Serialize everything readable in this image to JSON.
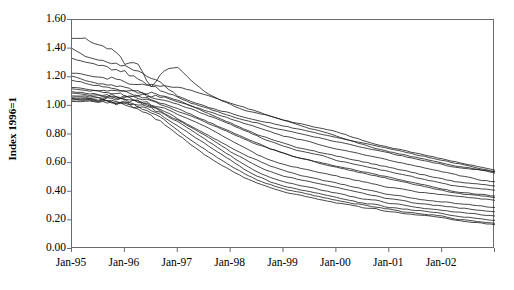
{
  "chart_data": {
    "type": "line",
    "title": "",
    "xlabel": "",
    "ylabel": "Index 1996=1",
    "ylim": [
      0.0,
      1.6
    ],
    "ytick_labels": [
      "1.60",
      "1.40",
      "1.20",
      "1.00",
      "0.80",
      "0.60",
      "0.40",
      "0.20",
      "0.00"
    ],
    "ytick_values": [
      1.6,
      1.4,
      1.2,
      1.0,
      0.8,
      0.6,
      0.4,
      0.2,
      0.0
    ],
    "xtick_labels": [
      "Jan-95",
      "Jan-96",
      "Jan-97",
      "Jan-98",
      "Jan-99",
      "Jan-00",
      "Jan-01",
      "Jan-02"
    ],
    "xlim_years": [
      1995.0,
      2003.0
    ],
    "grid": false,
    "legend": false,
    "legend_position": "none",
    "line_color": "#1a1a1a",
    "frame_color": "#6b6b6b",
    "series_count": 16,
    "x": [
      1995.0,
      1995.25,
      1995.5,
      1995.75,
      1996.0,
      1996.25,
      1996.5,
      1996.75,
      1997.0,
      1997.25,
      1997.5,
      1997.75,
      1998.0,
      1998.25,
      1998.5,
      1998.75,
      1999.0,
      1999.25,
      1999.5,
      1999.75,
      2000.0,
      2000.25,
      2000.5,
      2000.75,
      2001.0,
      2001.25,
      2001.5,
      2001.75,
      2002.0,
      2002.25,
      2002.5,
      2002.75,
      2003.0
    ],
    "series": [
      {
        "name": "series-01",
        "values": [
          1.47,
          1.47,
          1.42,
          1.4,
          1.3,
          1.28,
          1.13,
          1.25,
          1.27,
          1.18,
          1.1,
          1.05,
          1.01,
          0.97,
          0.95,
          0.93,
          0.9,
          0.88,
          0.86,
          0.84,
          0.82,
          0.79,
          0.76,
          0.73,
          0.71,
          0.69,
          0.67,
          0.65,
          0.63,
          0.61,
          0.59,
          0.57,
          0.55
        ]
      },
      {
        "name": "series-02",
        "values": [
          1.4,
          1.35,
          1.32,
          1.3,
          1.28,
          1.24,
          1.2,
          1.14,
          1.07,
          1.03,
          1.0,
          0.97,
          0.95,
          0.92,
          0.9,
          0.88,
          0.86,
          0.84,
          0.82,
          0.8,
          0.78,
          0.76,
          0.74,
          0.72,
          0.7,
          0.68,
          0.66,
          0.64,
          0.62,
          0.6,
          0.58,
          0.56,
          0.54
        ]
      },
      {
        "name": "series-03",
        "values": [
          1.33,
          1.31,
          1.29,
          1.26,
          1.23,
          1.19,
          1.14,
          1.1,
          1.06,
          1.02,
          0.99,
          0.96,
          0.93,
          0.9,
          0.88,
          0.85,
          0.83,
          0.81,
          0.79,
          0.77,
          0.75,
          0.73,
          0.71,
          0.69,
          0.67,
          0.65,
          0.63,
          0.61,
          0.59,
          0.57,
          0.56,
          0.55,
          0.53
        ]
      },
      {
        "name": "series-04",
        "values": [
          1.23,
          1.22,
          1.2,
          1.19,
          1.17,
          1.16,
          1.15,
          1.14,
          1.13,
          1.11,
          1.08,
          1.05,
          1.02,
          0.99,
          0.96,
          0.93,
          0.9,
          0.87,
          0.84,
          0.82,
          0.79,
          0.76,
          0.73,
          0.7,
          0.68,
          0.66,
          0.64,
          0.62,
          0.6,
          0.58,
          0.57,
          0.55,
          0.54
        ]
      },
      {
        "name": "series-05",
        "values": [
          1.21,
          1.18,
          1.16,
          1.14,
          1.12,
          1.1,
          1.09,
          1.07,
          1.04,
          1.0,
          0.97,
          0.94,
          0.91,
          0.88,
          0.85,
          0.82,
          0.79,
          0.77,
          0.75,
          0.72,
          0.7,
          0.68,
          0.66,
          0.64,
          0.62,
          0.6,
          0.58,
          0.56,
          0.54,
          0.52,
          0.5,
          0.48,
          0.47
        ]
      },
      {
        "name": "series-06",
        "values": [
          1.18,
          1.16,
          1.14,
          1.12,
          1.11,
          1.09,
          1.07,
          1.06,
          1.03,
          1.0,
          0.96,
          0.92,
          0.88,
          0.84,
          0.8,
          0.77,
          0.74,
          0.71,
          0.69,
          0.67,
          0.65,
          0.63,
          0.61,
          0.59,
          0.57,
          0.55,
          0.53,
          0.51,
          0.49,
          0.47,
          0.46,
          0.45,
          0.44
        ]
      },
      {
        "name": "series-07",
        "values": [
          1.13,
          1.12,
          1.11,
          1.11,
          1.1,
          1.08,
          1.06,
          1.04,
          1.01,
          0.98,
          0.94,
          0.91,
          0.87,
          0.83,
          0.79,
          0.75,
          0.72,
          0.69,
          0.67,
          0.65,
          0.62,
          0.6,
          0.58,
          0.56,
          0.54,
          0.52,
          0.5,
          0.48,
          0.46,
          0.44,
          0.43,
          0.42,
          0.41
        ]
      },
      {
        "name": "series-08",
        "values": [
          1.12,
          1.11,
          1.1,
          1.09,
          1.08,
          1.06,
          1.04,
          1.01,
          0.98,
          0.94,
          0.9,
          0.86,
          0.82,
          0.78,
          0.74,
          0.7,
          0.67,
          0.64,
          0.62,
          0.6,
          0.58,
          0.56,
          0.54,
          0.52,
          0.5,
          0.48,
          0.46,
          0.44,
          0.42,
          0.4,
          0.39,
          0.38,
          0.37
        ]
      },
      {
        "name": "series-09",
        "values": [
          1.1,
          1.09,
          1.08,
          1.07,
          1.06,
          1.05,
          1.03,
          1.0,
          0.96,
          0.93,
          0.89,
          0.85,
          0.81,
          0.77,
          0.73,
          0.7,
          0.67,
          0.64,
          0.62,
          0.59,
          0.57,
          0.55,
          0.53,
          0.51,
          0.49,
          0.47,
          0.45,
          0.43,
          0.41,
          0.39,
          0.38,
          0.37,
          0.36
        ]
      },
      {
        "name": "series-10",
        "values": [
          1.09,
          1.08,
          1.07,
          1.07,
          1.06,
          1.04,
          1.01,
          0.98,
          0.94,
          0.9,
          0.86,
          0.81,
          0.76,
          0.71,
          0.66,
          0.62,
          0.59,
          0.57,
          0.55,
          0.53,
          0.51,
          0.49,
          0.47,
          0.45,
          0.43,
          0.42,
          0.4,
          0.39,
          0.38,
          0.37,
          0.36,
          0.35,
          0.34
        ]
      },
      {
        "name": "series-11",
        "values": [
          1.07,
          1.07,
          1.06,
          1.06,
          1.05,
          1.03,
          1.0,
          0.96,
          0.91,
          0.86,
          0.81,
          0.76,
          0.71,
          0.66,
          0.62,
          0.58,
          0.55,
          0.52,
          0.5,
          0.48,
          0.46,
          0.44,
          0.42,
          0.4,
          0.38,
          0.37,
          0.35,
          0.34,
          0.33,
          0.32,
          0.31,
          0.3,
          0.29
        ]
      },
      {
        "name": "series-12",
        "values": [
          1.06,
          1.06,
          1.05,
          1.05,
          1.04,
          1.02,
          0.99,
          0.95,
          0.9,
          0.85,
          0.8,
          0.74,
          0.68,
          0.63,
          0.58,
          0.54,
          0.51,
          0.49,
          0.47,
          0.45,
          0.43,
          0.41,
          0.39,
          0.37,
          0.35,
          0.34,
          0.32,
          0.31,
          0.3,
          0.29,
          0.28,
          0.27,
          0.26
        ]
      },
      {
        "name": "series-13",
        "values": [
          1.05,
          1.05,
          1.04,
          1.04,
          1.03,
          1.01,
          0.98,
          0.94,
          0.89,
          0.83,
          0.77,
          0.71,
          0.65,
          0.59,
          0.54,
          0.5,
          0.47,
          0.45,
          0.43,
          0.41,
          0.39,
          0.37,
          0.35,
          0.34,
          0.32,
          0.31,
          0.29,
          0.28,
          0.27,
          0.26,
          0.25,
          0.24,
          0.23
        ]
      },
      {
        "name": "series-14",
        "values": [
          1.05,
          1.04,
          1.04,
          1.03,
          1.02,
          1.0,
          0.97,
          0.92,
          0.86,
          0.8,
          0.74,
          0.68,
          0.62,
          0.56,
          0.51,
          0.47,
          0.44,
          0.42,
          0.4,
          0.38,
          0.36,
          0.34,
          0.32,
          0.31,
          0.29,
          0.28,
          0.27,
          0.26,
          0.25,
          0.23,
          0.22,
          0.21,
          0.2
        ]
      },
      {
        "name": "series-15",
        "values": [
          1.04,
          1.04,
          1.03,
          1.03,
          1.02,
          0.99,
          0.95,
          0.9,
          0.83,
          0.76,
          0.7,
          0.64,
          0.58,
          0.53,
          0.48,
          0.45,
          0.42,
          0.4,
          0.38,
          0.36,
          0.34,
          0.32,
          0.31,
          0.29,
          0.28,
          0.26,
          0.25,
          0.24,
          0.23,
          0.21,
          0.2,
          0.19,
          0.18
        ]
      },
      {
        "name": "series-16",
        "values": [
          1.03,
          1.03,
          1.03,
          1.02,
          1.01,
          0.98,
          0.93,
          0.87,
          0.8,
          0.73,
          0.66,
          0.6,
          0.55,
          0.5,
          0.46,
          0.43,
          0.4,
          0.38,
          0.36,
          0.34,
          0.32,
          0.31,
          0.29,
          0.28,
          0.26,
          0.25,
          0.24,
          0.23,
          0.22,
          0.2,
          0.19,
          0.18,
          0.17
        ]
      }
    ]
  }
}
